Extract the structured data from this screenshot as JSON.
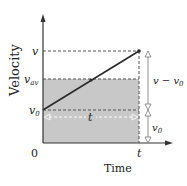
{
  "diagram": {
    "type": "velocity-time graph",
    "axes": {
      "x_label": "Time",
      "y_label": "Velocity",
      "origin_label": "0"
    },
    "y_levels": {
      "v": "v",
      "v_av": "v",
      "v_av_sub": "av",
      "v0": "v",
      "v0_sub": "0"
    },
    "x_marks": {
      "t": "t"
    },
    "annotations": {
      "interval_t": "t",
      "delta_v": "v − v",
      "delta_v_sub": "0",
      "v0_bracket": "v",
      "v0_bracket_sub": "0"
    },
    "colors": {
      "shade": "#c8c8c8",
      "line": "#2a2a2a",
      "axis": "#333333",
      "dash": "#555555"
    }
  }
}
